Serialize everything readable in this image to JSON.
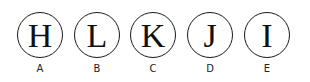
{
  "items": [
    {
      "letter": "H",
      "label": "A"
    },
    {
      "letter": "L",
      "label": "B"
    },
    {
      "letter": "K",
      "label": "C"
    },
    {
      "letter": "J",
      "label": "D"
    },
    {
      "letter": "I",
      "label": "E"
    }
  ]
}
